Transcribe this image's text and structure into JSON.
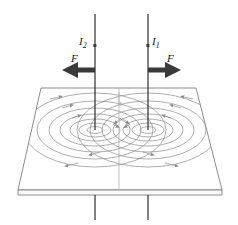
{
  "figure": {
    "labels": {
      "current_left": "I",
      "current_left_sub": "2",
      "current_right": "I",
      "current_right_sub": "1",
      "force_left": "F",
      "force_right": "F"
    },
    "colors": {
      "wire": "#1a1a1a",
      "arrow": "#333333",
      "field_line": "#8c8c8c",
      "plane_edge": "#6e6e6e",
      "center_line": "#b3b3b3",
      "text": "#1a1a1a",
      "background": "#ffffff"
    },
    "geometry": {
      "wire_left_x": 95,
      "wire_right_x": 148,
      "wire_top_y": 14,
      "wire_bottom_y": 220,
      "pierce_y": 130,
      "plane_top_y": 88,
      "plane_bottom_y": 190,
      "plane_top_left_x": 41,
      "plane_top_right_x": 196,
      "plane_bottom_left_x": 18,
      "plane_bottom_right_x": 222,
      "slab_thickness": 5,
      "center_x": 119
    },
    "force_arrows": {
      "left_direction": "left",
      "right_direction": "right",
      "y": 70,
      "length": 33
    },
    "field_lines": {
      "left_sense": "clockwise",
      "right_sense": "counterclockwise",
      "ring_count": 6
    }
  }
}
